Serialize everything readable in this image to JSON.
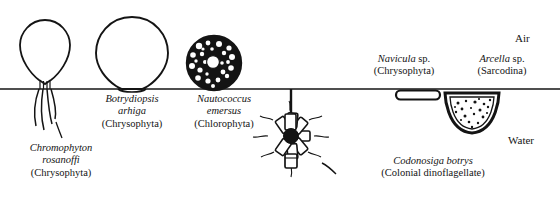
{
  "figure": {
    "width": 560,
    "height": 208,
    "background": "#ffffff",
    "ink": "#141414"
  },
  "zones": {
    "air_label": "Air",
    "water_label": "Water",
    "surface_line_y": 89
  },
  "organisms": [
    {
      "key": "chromophyton",
      "genus_species": "Chromophyton rosanoffi",
      "group": "(Chrysophyta)",
      "position": "above-surface",
      "form": "pear-shaped cell on surface film with four trailing filaments below"
    },
    {
      "key": "botrydiopsis",
      "genus_species": "Botrydiopsis arhiga",
      "group": "(Chrysophyta)",
      "position": "above-surface",
      "form": "large balloon-shaped cell resting on the surface film"
    },
    {
      "key": "nautococcus",
      "genus_species": "Nautococcus emersus",
      "group": "(Chlorophyta)",
      "position": "above-surface",
      "form": "rounded dark cell with mottled cytoplasm and central vacuole"
    },
    {
      "key": "navicula",
      "genus_species": "Navicula sp.",
      "group": "(Chrysophyta)",
      "position": "below-surface",
      "form": "boat-shaped diatom frustule hanging beneath the film"
    },
    {
      "key": "arcella",
      "genus_species": "Arcella sp.",
      "group": "(Sarcodina)",
      "position": "below-surface",
      "form": "dome-shaped test with granular contents suspended below the film"
    },
    {
      "key": "codonosiga",
      "genus_species": "Codonosiga botrys",
      "group": "(Colonial dinoflagellate)",
      "position": "below-surface",
      "form": "stalked rosette colony of collared cells suspended from the film"
    }
  ],
  "captions": {
    "chromophyton": {
      "line1": "Chromophyton",
      "line2": "rosanoffi",
      "line3": "(Chrysophyta)"
    },
    "botrydiopsis": {
      "line1": "Botrydiopsis",
      "line2": "arhiga",
      "line3": "(Chrysophyta)"
    },
    "nautococcus": {
      "line1": "Nautococcus",
      "line2": "emersus",
      "line3": "(Chlorophyta)"
    },
    "navicula": {
      "line1_sci": "Navicula",
      "line1_rom": " sp.",
      "line2": "(Chrysophyta)"
    },
    "arcella": {
      "line1_sci": "Arcella",
      "line1_rom": " sp.",
      "line2": "(Sarcodina)"
    },
    "codonosiga": {
      "line1": "Codonosiga botrys",
      "line2": "(Colonial dinoflagellate)"
    }
  }
}
